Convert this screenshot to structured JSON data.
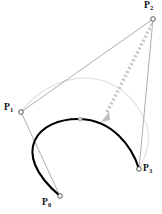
{
  "figure": {
    "type": "cubic-bezier-control-polygon-diagram",
    "background_color": "#ffffff",
    "width": 162,
    "height": 214,
    "curve_color": "#000000",
    "polygon_color": "#8c8c8c",
    "ghost_curve_color": "#e0e0e0",
    "arrow_color": "#c8c8c8",
    "marker_fill": "#ffffff",
    "marker_stroke": "#555555"
  },
  "control_points": [
    {
      "id": "P0",
      "label": "P",
      "sub": "0",
      "x": 60,
      "y": 196,
      "label_x": 42,
      "label_y": 199
    },
    {
      "id": "P1",
      "label": "P",
      "sub": "1",
      "x": 21,
      "y": 112,
      "label_x": 4,
      "label_y": 104
    },
    {
      "id": "P2",
      "label": "P",
      "sub": "2",
      "x": 153,
      "y": 19,
      "label_x": 144,
      "label_y": 1
    },
    {
      "id": "P3",
      "label": "P",
      "sub": "3",
      "x": 139,
      "y": 169,
      "label_x": 143,
      "label_y": 165
    }
  ],
  "polygon_segments": [
    {
      "name": "segment-p0-p1",
      "from": "P0",
      "to": "P1"
    },
    {
      "name": "segment-p1-p2",
      "from": "P1",
      "to": "P2"
    },
    {
      "name": "segment-p2-p3",
      "from": "P2",
      "to": "P3"
    }
  ],
  "bezier_curve": {
    "name": "cubic-bezier-curve",
    "path": "M 60 196 C 8 152 38 118 80 119 C 112 120 132 146 139 169",
    "stroke_width": 2.1
  },
  "ghost_curve": {
    "name": "ghost-bezier-curve",
    "path": "M 21 112 C 56 66 122 64 146 123 C 152 138 146 156 139 169",
    "stroke_width": 1.2
  },
  "drag_arrow": {
    "name": "drag-arrow",
    "from_x": 152,
    "from_y": 24,
    "to_x": 103,
    "to_y": 119,
    "dash": "2.2 2.2",
    "stroke_width": 3.4,
    "head_size": 4.5
  },
  "midpoint_handle": {
    "name": "curve-midpoint-handle",
    "x": 80,
    "y": 119,
    "size": 3.6
  }
}
